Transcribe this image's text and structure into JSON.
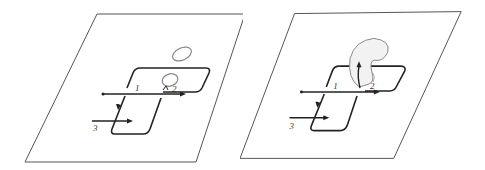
{
  "figure": {
    "panels": [
      {
        "id": "left",
        "labels": {
          "l1": "1",
          "l2": "2",
          "l3": "3"
        },
        "description": "Plane with wire loop and flat ellipses (before deformation)"
      },
      {
        "id": "right",
        "labels": {
          "l1": "1",
          "l2": "2",
          "l3": "3"
        },
        "description": "Plane with wire loop and curved bubble surface (after deformation)"
      }
    ],
    "colors": {
      "stroke": "#222222",
      "plane_stroke": "#555555",
      "ellipse_stroke": "#888888",
      "bubble_fill": "#f2f2f2"
    }
  }
}
